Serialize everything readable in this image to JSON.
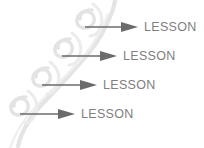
{
  "diagram": {
    "background_color": "#ffffff",
    "arrow_color": "#6b6b6b",
    "label_color": "#808080",
    "vine_color": "#e2e2e2",
    "vine_color_light": "#eeeeee",
    "steps": [
      {
        "label": "LESSON",
        "order": 1,
        "x": 85,
        "y": 16,
        "arrow_length": 53,
        "icon": "right-arrow-icon"
      },
      {
        "label": "LESSON",
        "order": 2,
        "x": 62,
        "y": 45,
        "arrow_length": 55,
        "icon": "right-arrow-icon"
      },
      {
        "label": "LESSON",
        "order": 3,
        "x": 42,
        "y": 74,
        "arrow_length": 55,
        "icon": "right-arrow-icon"
      },
      {
        "label": "LESSON",
        "order": 4,
        "x": 20,
        "y": 103,
        "arrow_length": 55,
        "icon": "right-arrow-icon"
      }
    ],
    "decoration": {
      "name": "vine-swirl-decoration",
      "description": "diagonal stylized vine with four leaf curls"
    }
  }
}
